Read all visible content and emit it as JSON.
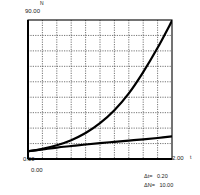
{
  "chart_data": {
    "type": "line",
    "title": "",
    "xlabel": "t",
    "ylabel": "N",
    "xlim": [
      0,
      2.0
    ],
    "ylim": [
      0,
      90.0
    ],
    "x_tick_labels": [
      "0.00",
      "2.00"
    ],
    "y_tick_labels": [
      "0.00",
      "90.00"
    ],
    "grid": true,
    "grid_style": "dotted",
    "grid_x_divisions": 10,
    "grid_y_divisions": 9,
    "x_step": 0.2,
    "y_step": 10.0,
    "legend_position": "bottom-right",
    "annotations": [
      {
        "label": "Δt=",
        "value": "0.20"
      },
      {
        "label": "ΔN=",
        "value": "10.00"
      }
    ],
    "series": [
      {
        "name": "exponential-growth",
        "color": "#000000",
        "line_width": 2.2,
        "x": [
          0.0,
          0.2,
          0.4,
          0.6,
          0.8,
          1.0,
          1.2,
          1.4,
          1.6,
          1.8,
          2.0
        ],
        "values": [
          5.0,
          6.6,
          8.9,
          12.2,
          16.8,
          23.2,
          31.6,
          42.5,
          56.3,
          72.0,
          89.5
        ]
      },
      {
        "name": "slow-growth",
        "color": "#000000",
        "line_width": 2.2,
        "x": [
          0.0,
          0.2,
          0.4,
          0.6,
          0.8,
          1.0,
          1.2,
          1.4,
          1.6,
          1.8,
          2.0
        ],
        "values": [
          5.0,
          6.2,
          7.4,
          8.4,
          9.4,
          10.3,
          11.1,
          11.9,
          12.7,
          13.6,
          14.6
        ]
      }
    ]
  },
  "axes": {
    "y_axis_name": "N",
    "x_axis_name": "t",
    "y_max": "90.00",
    "y_min": "0.00",
    "x_min": "0.00",
    "x_max": "2.00"
  },
  "legend": {
    "delta_t_label": "Δt=",
    "delta_t_value": "0.20",
    "delta_n_label": "ΔN=",
    "delta_n_value": "10.00"
  }
}
